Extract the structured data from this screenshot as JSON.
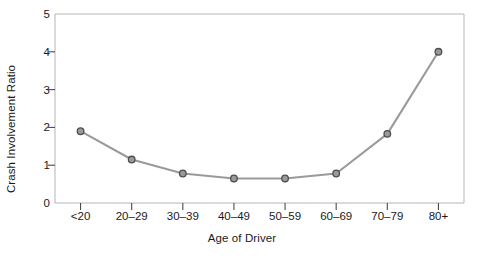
{
  "chart_data": {
    "type": "line",
    "title": "",
    "xlabel": "Age of Driver",
    "ylabel": "Crash Involvement Ratio",
    "categories": [
      "<20",
      "20–29",
      "30–39",
      "40–49",
      "50–59",
      "60–69",
      "70–79",
      "80+"
    ],
    "values": [
      1.9,
      1.15,
      0.78,
      0.65,
      0.65,
      0.78,
      1.83,
      4.0
    ],
    "ylim": [
      0,
      5
    ],
    "yticks": [
      "0",
      "1",
      "2",
      "3",
      "4",
      "5"
    ],
    "ytick_values": [
      0,
      1,
      2,
      3,
      4,
      5
    ],
    "grid": false,
    "legend": "none",
    "marker": "circle",
    "line_color": "#999999",
    "marker_fill": "#9a9a9a",
    "marker_edge": "#4d4d4d",
    "axis_color": "#b0b0b0",
    "text_color": "#1a1a1a"
  },
  "axes": {
    "y_axis_title": "Crash Involvement Ratio",
    "x_axis_title": "Age of Driver"
  }
}
